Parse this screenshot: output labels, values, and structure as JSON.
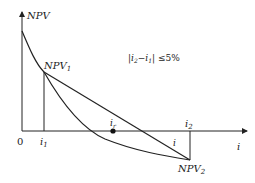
{
  "diagram": {
    "title": "",
    "y_axis_label": "NPV",
    "x_axis_label": "i",
    "origin_label": "0",
    "point_npv1": {
      "label": "NPV",
      "sub": "1"
    },
    "point_npv2": {
      "label": "NPV",
      "sub": "2"
    },
    "tick_i1": {
      "label": "i",
      "sub": "1"
    },
    "tick_i2": {
      "label": "i",
      "sub": "2"
    },
    "intersection": {
      "label": "i",
      "sub": "r"
    },
    "curve_label": "i",
    "condition": {
      "prefix": "|i",
      "sub_a": "2",
      "mid": "−i",
      "sub_b": "1",
      "suffix": "| ≤5%"
    },
    "colors": {
      "line": "#222222",
      "background": "#ffffff"
    }
  }
}
